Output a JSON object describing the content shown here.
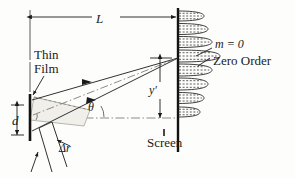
{
  "figure": {
    "background_color": "#fdfdfb",
    "ink_color": "#1b1b1b"
  },
  "labels": {
    "distance_L": "L",
    "thin": "Thin",
    "film": "Film",
    "thickness_d": "d",
    "path_difference": "Δr",
    "angle_theta": "θ",
    "screen_height": "y′",
    "screen": "Screen",
    "order_m": "m = 0",
    "zero_order": "Zero Order"
  },
  "geometry": {
    "film_x": 30,
    "screen_x": 178,
    "axis_y": 118,
    "film_top_y": 95,
    "film_bottom_y": 140,
    "converge_x": 178,
    "converge_y": 58,
    "L_arrow_y": 17,
    "y_prime_x": 160,
    "y_prime_top": 58,
    "y_prime_bottom": 118
  },
  "chart_data": {
    "type": "line",
    "xlabel": "Intensity",
    "ylabel": "Position on screen",
    "orientation": "horizontal-lobes",
    "baseline_x": 178,
    "note": "Interference intensity lobes plotted sideways off the screen line; the central maximum aligns with the m = 0 zero order ray.",
    "lobes": [
      {
        "center_y": 16,
        "half_height": 5.0,
        "amplitude": 26,
        "order": 4
      },
      {
        "center_y": 29,
        "half_height": 5.5,
        "amplitude": 30,
        "order": 3
      },
      {
        "center_y": 42,
        "half_height": 5.5,
        "amplitude": 34,
        "order": 2
      },
      {
        "center_y": 56,
        "half_height": 6.0,
        "amplitude": 42,
        "order": 1
      },
      {
        "center_y": 70,
        "half_height": 6.0,
        "amplitude": 34,
        "order": 0
      },
      {
        "center_y": 84,
        "half_height": 6.0,
        "amplitude": 30,
        "order": -1
      },
      {
        "center_y": 98,
        "half_height": 5.5,
        "amplitude": 26,
        "order": -2
      },
      {
        "center_y": 112,
        "half_height": 5.0,
        "amplitude": 22,
        "order": -3
      }
    ]
  }
}
